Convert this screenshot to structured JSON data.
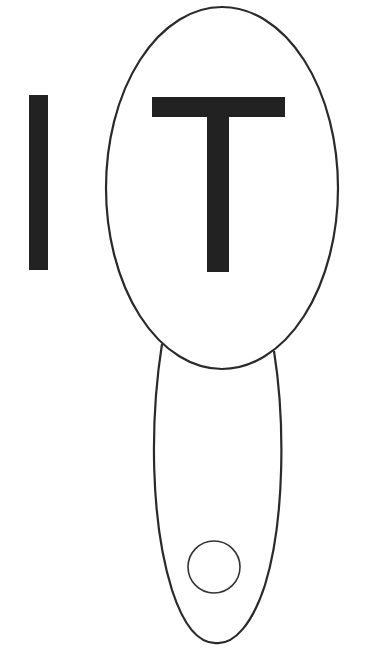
{
  "diagram": {
    "letters": [
      "I",
      "T"
    ],
    "colors": {
      "background": "#ffffff",
      "ink": "#222222",
      "stroke": "#2a2a2a"
    },
    "shapes": {
      "large_ellipse": {
        "cx": 222,
        "cy": 188,
        "rx": 116,
        "ry": 181
      },
      "lower_elongated_shape": {
        "top_left": [
          162,
          344
        ],
        "top_right": [
          274,
          351
        ],
        "bottom": [
          217,
          643
        ]
      },
      "small_circle": {
        "cx": 214,
        "cy": 567,
        "r": 26
      }
    }
  }
}
